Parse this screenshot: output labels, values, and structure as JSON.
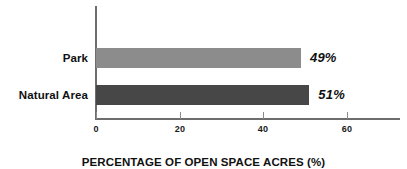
{
  "chart_data": {
    "type": "bar",
    "orientation": "horizontal",
    "title": "",
    "xlabel": "PERCENTAGE OF OPEN SPACE ACRES (%)",
    "ylabel": "",
    "categories": [
      "Park",
      "Natural Area"
    ],
    "values": [
      49,
      51
    ],
    "data_labels": [
      "49%",
      "51%"
    ],
    "series": [
      {
        "name": "Percentage of open space acres",
        "values": [
          49,
          51
        ]
      }
    ],
    "bar_colors": [
      "#8c8c8c",
      "#474747"
    ],
    "xlim": [
      0,
      72.8
    ],
    "xticks": [
      0,
      20,
      40,
      60
    ],
    "xtick_labels": [
      "0",
      "20",
      "40",
      "60"
    ],
    "grid": false,
    "legend": false,
    "axis_color": "#6d6d6d"
  },
  "axis": {
    "x_title": "PERCENTAGE OF OPEN SPACE ACRES (%)",
    "ticks": [
      {
        "label": "0",
        "value": 0
      },
      {
        "label": "20",
        "value": 20
      },
      {
        "label": "40",
        "value": 40
      },
      {
        "label": "60",
        "value": 60
      }
    ]
  },
  "bars": [
    {
      "category": "Park",
      "value": 49,
      "label": "49%",
      "color": "#8c8c8c"
    },
    {
      "category": "Natural Area",
      "value": 51,
      "label": "51%",
      "color": "#474747"
    }
  ]
}
